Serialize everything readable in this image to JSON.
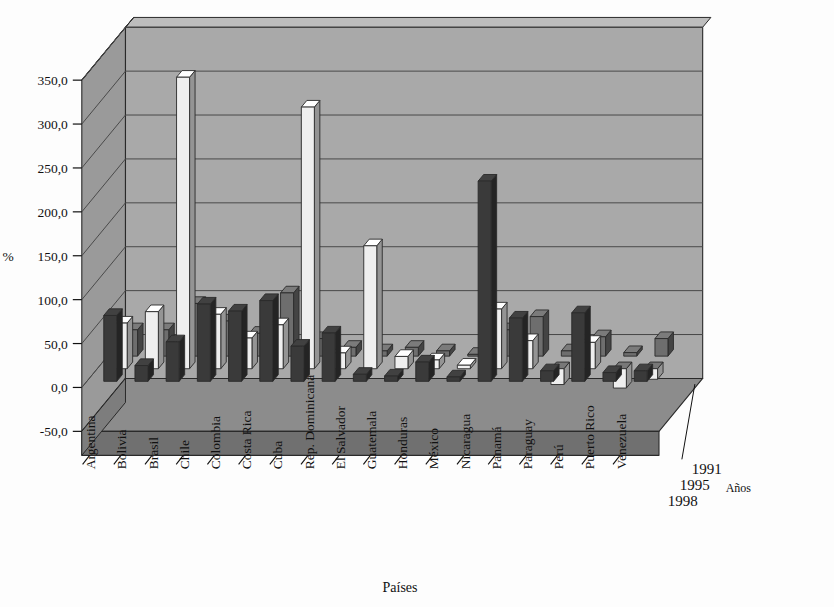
{
  "chart_data": {
    "type": "bar",
    "title": "",
    "xlabel": "Países",
    "ylabel": "%",
    "zlabel": "Años",
    "ylim": [
      -50,
      350
    ],
    "ytick_step": 50,
    "ytick_labels": [
      "350,0",
      "300,0",
      "250,0",
      "200,0",
      "150,0",
      "100,0",
      "50,0",
      "0,0",
      "-50,0"
    ],
    "yticks": [
      350,
      300,
      250,
      200,
      150,
      100,
      50,
      0,
      -50
    ],
    "grid": true,
    "legend_position": "right-depth-axis",
    "projection": "3d-row-offset",
    "categories": [
      "Argentina",
      "Bolivia",
      "Brasil",
      "Chile",
      "Colombia",
      "Costa Rica",
      "Cuba",
      "Rep. Dominicana",
      "El Salvador",
      "Guatemala",
      "Honduras",
      "México",
      "Nicaragua",
      "Panamá",
      "Paraguay",
      "Perú",
      "Puerto Rico",
      "Venezuela"
    ],
    "series": [
      {
        "name": "1991",
        "color": "#3a3a3a",
        "values": [
          75,
          18,
          45,
          88,
          80,
          92,
          40,
          55,
          8,
          6,
          22,
          5,
          228,
          72,
          12,
          78,
          10,
          12
        ]
      },
      {
        "name": "1995",
        "color": "#efefef",
        "values": [
          52,
          65,
          332,
          62,
          35,
          50,
          298,
          18,
          140,
          14,
          10,
          4,
          68,
          32,
          -18,
          30,
          -22,
          -12
        ]
      },
      {
        "name": "1998",
        "color": "#6e6e6e",
        "values": [
          30,
          30,
          60,
          40,
          26,
          72,
          20,
          10,
          6,
          10,
          6,
          2,
          30,
          45,
          6,
          22,
          4,
          20
        ]
      }
    ]
  },
  "colors": {
    "wall_back": "#a9a9a9",
    "wall_side": "#9a9a9a",
    "wall_top": "#bdbdbd",
    "floor": "#8c8c8c",
    "floor_front": "#707070",
    "grid": "#4a4a4a",
    "outline": "#2a2a2a",
    "series_1991": "#3a3a3a",
    "series_1995": "#efefef",
    "series_1998": "#6e6e6e",
    "background": "#fdfdfd"
  }
}
